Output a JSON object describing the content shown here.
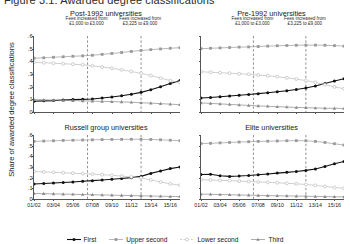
{
  "figure": {
    "title": "Figure 3.1: Awarded degree classifications",
    "ylabel": "Share of awarded degree classifications"
  },
  "annotations": {
    "fee1_line1": "Fees increased from",
    "fee1_line2": "£1,000 to £3,000",
    "fee2_line1": "Fees increased from",
    "fee2_line2": "£3,225 to £9,000"
  },
  "legend": [
    {
      "label": "First",
      "marker": "filled-circle",
      "color": "#111111"
    },
    {
      "label": "Upper second",
      "marker": "filled-square",
      "color": "#9a9a9a"
    },
    {
      "label": "Lower second",
      "marker": "open-circle",
      "color": "#bcbcbc"
    },
    {
      "label": "Third",
      "marker": "filled-triangle",
      "color": "#8a8a8a"
    }
  ],
  "axis": {
    "ylim": [
      0,
      0.6
    ],
    "yticks": [
      "0",
      ".1",
      ".2",
      ".3",
      ".4",
      ".5",
      ".6"
    ],
    "ytick_values": [
      0,
      0.1,
      0.2,
      0.3,
      0.4,
      0.5,
      0.6
    ],
    "xticks": [
      "01/02",
      "03/04",
      "05/06",
      "07/08",
      "09/10",
      "11/12",
      "13/14",
      "15/16"
    ],
    "xtick_values": [
      2001,
      2003,
      2005,
      2007,
      2009,
      2011,
      2013,
      2015
    ],
    "xlim": [
      2001,
      2016
    ],
    "xlabel": "",
    "grid": false,
    "vlines": [
      2006.5,
      2012.0
    ]
  },
  "chart_data": {
    "type": "line",
    "title": "Figure 3.1: Awarded degree classifications",
    "xlabel": "",
    "ylabel": "Share of awarded degree classifications",
    "ylim": [
      0,
      0.6
    ],
    "grid": false,
    "legend_position": "bottom",
    "x": [
      2001,
      2002,
      2003,
      2004,
      2005,
      2006,
      2007,
      2008,
      2009,
      2010,
      2011,
      2012,
      2013,
      2014,
      2015,
      2016
    ],
    "xtick_labels": [
      "01/02",
      "03/04",
      "05/06",
      "07/08",
      "09/10",
      "11/12",
      "13/14",
      "15/16"
    ],
    "panels": [
      {
        "name": "Post-1992 universities",
        "series": [
          {
            "name": "First",
            "marker": "filled-circle",
            "color": "#111111",
            "values": [
              0.085,
              0.088,
              0.09,
              0.095,
              0.098,
              0.1,
              0.103,
              0.11,
              0.118,
              0.128,
              0.14,
              0.155,
              0.175,
              0.2,
              0.225,
              0.248
            ]
          },
          {
            "name": "Upper second",
            "marker": "filled-square",
            "color": "#9a9a9a",
            "values": [
              0.425,
              0.428,
              0.432,
              0.436,
              0.44,
              0.443,
              0.448,
              0.455,
              0.462,
              0.47,
              0.478,
              0.486,
              0.492,
              0.498,
              0.503,
              0.508
            ]
          },
          {
            "name": "Lower second",
            "marker": "open-circle",
            "color": "#bcbcbc",
            "values": [
              0.392,
              0.389,
              0.385,
              0.381,
              0.377,
              0.373,
              0.365,
              0.355,
              0.345,
              0.333,
              0.32,
              0.305,
              0.288,
              0.268,
              0.248,
              0.232
            ]
          },
          {
            "name": "Third",
            "marker": "filled-triangle",
            "color": "#8a8a8a",
            "values": [
              0.098,
              0.096,
              0.094,
              0.092,
              0.09,
              0.088,
              0.086,
              0.084,
              0.082,
              0.08,
              0.077,
              0.073,
              0.07,
              0.066,
              0.062,
              0.058
            ]
          }
        ]
      },
      {
        "name": "Pre-1992 universities",
        "series": [
          {
            "name": "First",
            "marker": "filled-circle",
            "color": "#111111",
            "values": [
              0.11,
              0.115,
              0.12,
              0.126,
              0.132,
              0.138,
              0.145,
              0.152,
              0.16,
              0.168,
              0.178,
              0.19,
              0.205,
              0.225,
              0.245,
              0.262
            ]
          },
          {
            "name": "Upper second",
            "marker": "filled-square",
            "color": "#9a9a9a",
            "values": [
              0.5,
              0.503,
              0.506,
              0.509,
              0.512,
              0.514,
              0.517,
              0.52,
              0.523,
              0.525,
              0.527,
              0.528,
              0.528,
              0.527,
              0.524,
              0.52
            ]
          },
          {
            "name": "Lower second",
            "marker": "open-circle",
            "color": "#bcbcbc",
            "values": [
              0.318,
              0.314,
              0.31,
              0.306,
              0.302,
              0.298,
              0.292,
              0.286,
              0.278,
              0.27,
              0.26,
              0.248,
              0.234,
              0.216,
              0.198,
              0.184
            ]
          },
          {
            "name": "Third",
            "marker": "filled-triangle",
            "color": "#8a8a8a",
            "values": [
              0.072,
              0.068,
              0.064,
              0.06,
              0.056,
              0.052,
              0.048,
              0.045,
              0.042,
              0.039,
              0.036,
              0.034,
              0.032,
              0.03,
              0.029,
              0.028
            ]
          }
        ]
      },
      {
        "name": "Russell group universities",
        "series": [
          {
            "name": "First",
            "marker": "filled-circle",
            "color": "#111111",
            "values": [
              0.14,
              0.145,
              0.15,
              0.155,
              0.16,
              0.166,
              0.172,
              0.178,
              0.185,
              0.192,
              0.2,
              0.212,
              0.24,
              0.262,
              0.285,
              0.3
            ]
          },
          {
            "name": "Upper second",
            "marker": "filled-square",
            "color": "#9a9a9a",
            "values": [
              0.54,
              0.543,
              0.546,
              0.549,
              0.551,
              0.553,
              0.555,
              0.557,
              0.558,
              0.559,
              0.56,
              0.56,
              0.558,
              0.555,
              0.551,
              0.547
            ]
          },
          {
            "name": "Lower second",
            "marker": "open-circle",
            "color": "#bcbcbc",
            "values": [
              0.258,
              0.254,
              0.25,
              0.246,
              0.242,
              0.238,
              0.233,
              0.228,
              0.222,
              0.215,
              0.207,
              0.198,
              0.178,
              0.16,
              0.142,
              0.13
            ]
          },
          {
            "name": "Third",
            "marker": "filled-triangle",
            "color": "#8a8a8a",
            "values": [
              0.052,
              0.05,
              0.048,
              0.046,
              0.044,
              0.042,
              0.04,
              0.038,
              0.036,
              0.034,
              0.032,
              0.03,
              0.028,
              0.026,
              0.024,
              0.023
            ]
          }
        ]
      },
      {
        "name": "Elite universities",
        "series": [
          {
            "name": "First",
            "marker": "filled-circle",
            "color": "#111111",
            "values": [
              0.23,
              0.232,
              0.218,
              0.212,
              0.215,
              0.22,
              0.228,
              0.235,
              0.243,
              0.25,
              0.258,
              0.268,
              0.282,
              0.305,
              0.33,
              0.352
            ]
          },
          {
            "name": "Upper second",
            "marker": "filled-square",
            "color": "#9a9a9a",
            "values": [
              0.52,
              0.522,
              0.526,
              0.53,
              0.534,
              0.537,
              0.54,
              0.542,
              0.544,
              0.546,
              0.547,
              0.546,
              0.54,
              0.53,
              0.518,
              0.506
            ]
          },
          {
            "name": "Lower second",
            "marker": "open-circle",
            "color": "#bcbcbc",
            "values": [
              0.182,
              0.178,
              0.175,
              0.172,
              0.168,
              0.164,
              0.16,
              0.156,
              0.152,
              0.147,
              0.142,
              0.136,
              0.128,
              0.118,
              0.108,
              0.1
            ]
          },
          {
            "name": "Third",
            "marker": "filled-triangle",
            "color": "#8a8a8a",
            "values": [
              0.046,
              0.044,
              0.042,
              0.04,
              0.038,
              0.036,
              0.034,
              0.032,
              0.03,
              0.029,
              0.027,
              0.026,
              0.024,
              0.022,
              0.021,
              0.02
            ]
          }
        ]
      }
    ]
  }
}
